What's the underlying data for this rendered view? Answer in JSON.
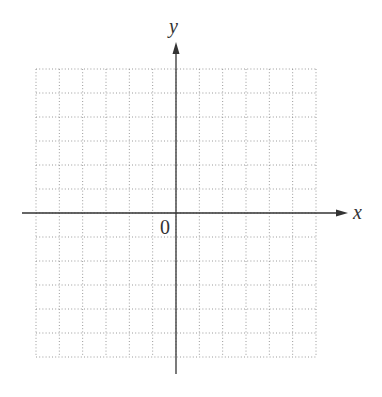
{
  "diagram": {
    "type": "coordinate-plane",
    "x_axis_label": "x",
    "y_axis_label": "y",
    "origin_label": "0",
    "grid": {
      "columns": 12,
      "rows": 12,
      "style": "dotted",
      "line_color": "#9a9a9a"
    },
    "axis_color": "#333333"
  }
}
